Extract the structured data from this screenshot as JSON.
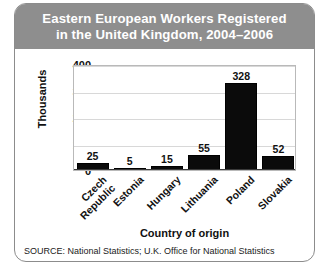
{
  "figure": {
    "title_line_1": "Eastern European Workers Registered",
    "title_line_2": "in the United Kingdom, 2004–2006",
    "source": "SOURCE: National Statistics; U.K. Office for National Statistics",
    "title_bg_color": "#8e8e8e",
    "title_text_color": "#ffffff",
    "bar_color": "#0b0b0b",
    "grid_color": "#d8d8d8",
    "border_color": "#8c8c8c"
  },
  "chart_data": {
    "type": "bar",
    "title": "Eastern European Workers Registered in the United Kingdom, 2004–2006",
    "categories": [
      "Czech Republic",
      "Estonia",
      "Hungary",
      "Lithuania",
      "Poland",
      "Slovakia"
    ],
    "category_lines": [
      [
        "Czech",
        "Republic"
      ],
      [
        "Estonia"
      ],
      [
        "Hungary"
      ],
      [
        "Lithuania"
      ],
      [
        "Poland"
      ],
      [
        "Slovakia"
      ]
    ],
    "values": [
      25,
      5,
      15,
      55,
      328,
      52
    ],
    "xlabel": "Country of origin",
    "ylabel": "Thousands",
    "ylim": [
      0,
      400
    ],
    "yticks": [
      0,
      100,
      200,
      300,
      400
    ],
    "ytick_labels": [
      "0",
      "100",
      "200",
      "300",
      "400"
    ],
    "grid": true,
    "legend": "none",
    "value_labels": [
      "25",
      "5",
      "15",
      "55",
      "328",
      "52"
    ]
  }
}
